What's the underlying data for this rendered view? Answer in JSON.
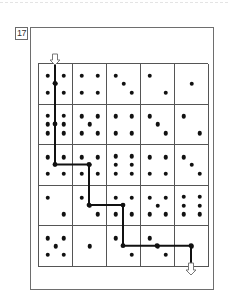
{
  "puzzle": {
    "number": "17",
    "rows": 5,
    "cols": 5,
    "dice": [
      [
        5,
        4,
        3,
        2,
        1
      ],
      [
        6,
        5,
        4,
        3,
        2
      ],
      [
        4,
        5,
        6,
        4,
        3
      ],
      [
        2,
        3,
        4,
        5,
        6
      ],
      [
        5,
        1,
        2,
        3,
        1
      ]
    ],
    "entry": {
      "row": 0,
      "col": 0,
      "icon": "arrow-down-outline-icon"
    },
    "exit": {
      "row": 4,
      "col": 4,
      "icon": "arrow-down-outline-icon"
    },
    "path_cells": [
      [
        0,
        0
      ],
      [
        1,
        0
      ],
      [
        2,
        0
      ],
      [
        2,
        1
      ],
      [
        3,
        1
      ],
      [
        3,
        2
      ],
      [
        4,
        2
      ],
      [
        4,
        3
      ],
      [
        4,
        4
      ]
    ],
    "colors": {
      "line": "#111111",
      "grid": "#555555",
      "frame": "#6e6e6e",
      "pip": "#111111"
    }
  }
}
